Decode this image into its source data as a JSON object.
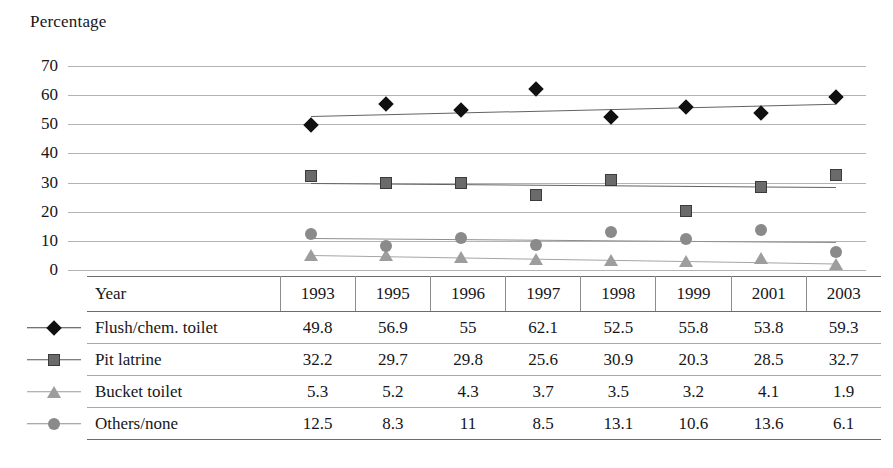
{
  "axis_title": "Percentage",
  "chart_data": {
    "type": "scatter",
    "title": "Percentage",
    "xlabel": "Year",
    "ylabel": "Percentage",
    "ylim": [
      0,
      70
    ],
    "yticks": [
      70,
      60,
      50,
      40,
      30,
      20,
      10,
      0
    ],
    "grid": true,
    "legend_position": "table-below",
    "categories": [
      "1993",
      "1995",
      "1996",
      "1997",
      "1998",
      "1999",
      "2001",
      "2003"
    ],
    "series": [
      {
        "name": "Flush/chem. toilet",
        "marker": "diamond",
        "color": "#101010",
        "values": [
          49.8,
          56.9,
          55,
          62.1,
          52.5,
          55.8,
          53.8,
          59.3
        ],
        "trendline": [
          52.8,
          57.0
        ]
      },
      {
        "name": "Pit latrine",
        "marker": "square",
        "color": "#6a6a6a",
        "values": [
          32.2,
          29.7,
          29.8,
          25.6,
          30.9,
          20.3,
          28.5,
          32.7
        ],
        "trendline": [
          29.8,
          28.4
        ]
      },
      {
        "name": "Bucket toilet",
        "marker": "triangle",
        "color": "#9d9d9d",
        "values": [
          5.3,
          5.2,
          4.3,
          3.7,
          3.5,
          3.2,
          4.1,
          1.9
        ],
        "trendline": [
          5.3,
          2.4
        ]
      },
      {
        "name": "Others/none",
        "marker": "circle",
        "color": "#8a8a8a",
        "values": [
          12.5,
          8.3,
          11,
          8.5,
          13.1,
          10.6,
          13.6,
          6.1
        ],
        "trendline": [
          10.9,
          9.5
        ]
      }
    ]
  },
  "table": {
    "header": {
      "key": "",
      "label": "Year",
      "years": [
        "1993",
        "1995",
        "1996",
        "1997",
        "1998",
        "1999",
        "2001",
        "2003"
      ]
    },
    "rows": [
      {
        "marker": "diamond-marker",
        "label": "Flush/chem. toilet",
        "values": [
          "49.8",
          "56.9",
          "55",
          "62.1",
          "52.5",
          "55.8",
          "53.8",
          "59.3"
        ]
      },
      {
        "marker": "square-marker",
        "label": "Pit latrine",
        "values": [
          "32.2",
          "29.7",
          "29.8",
          "25.6",
          "30.9",
          "20.3",
          "28.5",
          "32.7"
        ]
      },
      {
        "marker": "triangle-marker",
        "label": "Bucket toilet",
        "values": [
          "5.3",
          "5.2",
          "4.3",
          "3.7",
          "3.5",
          "3.2",
          "4.1",
          "1.9"
        ]
      },
      {
        "marker": "circle-marker",
        "label": "Others/none",
        "values": [
          "12.5",
          "8.3",
          "11",
          "8.5",
          "13.1",
          "10.6",
          "13.6",
          "6.1"
        ]
      }
    ]
  },
  "colors": {
    "series_1": "#101010",
    "series_2": "#6a6a6a",
    "series_3": "#9d9d9d",
    "series_4": "#8a8a8a",
    "gridline": "#9a9a9a",
    "rule": "#6d6d6d"
  }
}
